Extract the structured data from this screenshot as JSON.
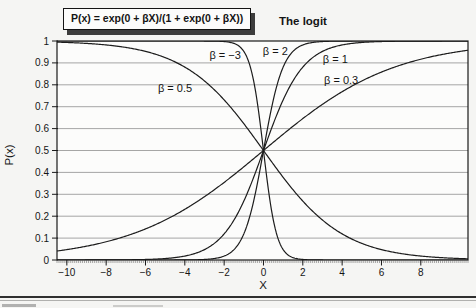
{
  "header": {
    "formula": "P(x) = exp(0 + βX)/(1 + exp(0 + βX))",
    "title": "The logit"
  },
  "chart_data": {
    "type": "line",
    "title": "The logit",
    "formula": "P(x) = exp(0 + βX)/(1 + exp(0 + βX))",
    "intercept": 0,
    "xlabel": "X",
    "ylabel": "P(x)",
    "xlim": [
      -10.5,
      10.4
    ],
    "ylim": [
      0,
      1
    ],
    "grid": "horizontal-only",
    "legend": "inline-curve-labels",
    "x_minor_tick_step": 0.1,
    "sample_step": 0.05,
    "x_ticks": [
      {
        "v": -10,
        "label": "−10"
      },
      {
        "v": -8,
        "label": "−8"
      },
      {
        "v": -6,
        "label": "−6"
      },
      {
        "v": -4,
        "label": "−4"
      },
      {
        "v": -2,
        "label": "−2"
      },
      {
        "v": 0,
        "label": "0"
      },
      {
        "v": 2,
        "label": "2"
      },
      {
        "v": 4,
        "label": "4"
      },
      {
        "v": 6,
        "label": "6"
      },
      {
        "v": 8,
        "label": "8"
      }
    ],
    "y_ticks": [
      {
        "v": 0,
        "label": "0"
      },
      {
        "v": 0.1,
        "label": "0.1"
      },
      {
        "v": 0.2,
        "label": "0.2"
      },
      {
        "v": 0.3,
        "label": "0.3"
      },
      {
        "v": 0.4,
        "label": "0.4"
      },
      {
        "v": 0.5,
        "label": "0.5"
      },
      {
        "v": 0.6,
        "label": "0.6"
      },
      {
        "v": 0.7,
        "label": "0.7"
      },
      {
        "v": 0.8,
        "label": "0.8"
      },
      {
        "v": 0.9,
        "label": "0.9"
      },
      {
        "v": 1,
        "label": "1"
      }
    ],
    "series": [
      {
        "label": "β = −3",
        "beta": -3,
        "direction": "decreasing",
        "label_pos": {
          "x": -1.95,
          "y": 0.935
        }
      },
      {
        "label": "β = 2",
        "beta": 2,
        "direction": "increasing",
        "label_pos": {
          "x": 0.6,
          "y": 0.95
        }
      },
      {
        "label": "β = 1",
        "beta": 1,
        "direction": "increasing",
        "label_pos": {
          "x": 3.65,
          "y": 0.915
        }
      },
      {
        "label": "β = 0.3",
        "beta": 0.3,
        "direction": "increasing",
        "label_pos": {
          "x": 3.95,
          "y": 0.82
        }
      },
      {
        "label": "β = 0.5",
        "beta": -0.5,
        "direction": "decreasing",
        "label_pos": {
          "x": -4.5,
          "y": 0.785
        }
      }
    ],
    "colors": {
      "curve": "#1c1c1c",
      "grid": "#8f8f8f",
      "axis": "#1a1a1a",
      "plot_bg": "#fcfcfb"
    }
  }
}
